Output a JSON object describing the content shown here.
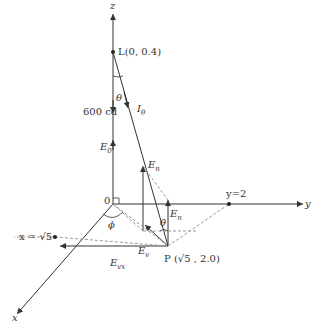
{
  "diagram": {
    "axes": {
      "z": "z",
      "y": "y",
      "x": "x"
    },
    "origin": "0",
    "source_label": "L(0, 0.4)",
    "intensity_label": "600 cd",
    "theta": "θ",
    "phi": "ϕ",
    "I_theta": "I",
    "I_theta_sub": "θ",
    "E0": "E",
    "E0_sub": "0",
    "En_top": "E",
    "En_top_sub": "n",
    "En_mid": "E",
    "En_mid_sub": "n",
    "Ev": "E",
    "Ev_sub": "v",
    "Evx": "E",
    "Evx_sub": "vx",
    "point_P": "P (√5 , 2.0)",
    "y_mark": "y=2",
    "x_mark": "x = √5",
    "colors": {
      "line": "#333333",
      "dash": "#999999"
    }
  }
}
